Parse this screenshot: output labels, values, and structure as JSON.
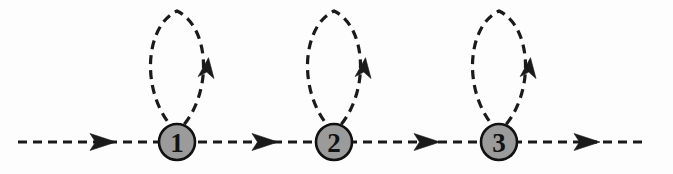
{
  "figure": {
    "background_color": "#fdfdfd",
    "line_color": "#1a1a1a",
    "vertex_fill_color": "#9b9b9b",
    "vertex_stroke_color": "#111111",
    "label_color": "#121212",
    "dash_pattern": "9 6",
    "stroke_width": 3.2,
    "width": 673,
    "height": 174
  },
  "main_line": {
    "name": "horizontal-propagator",
    "style": "dashed",
    "y": 142,
    "x_start": 18,
    "x_end": 646,
    "direction": "left-to-right",
    "arrow_positions": [
      96,
      258,
      420,
      580
    ]
  },
  "vertices": [
    {
      "id": "vertex-1",
      "label": "1",
      "cx": 177,
      "cy": 142,
      "r": 18
    },
    {
      "id": "vertex-2",
      "label": "2",
      "cx": 334,
      "cy": 142,
      "r": 18
    },
    {
      "id": "vertex-3",
      "label": "3",
      "cx": 499,
      "cy": 142,
      "r": 18
    }
  ],
  "loops": [
    {
      "id": "loop-1",
      "attached_to": "vertex-1",
      "style": "dashed",
      "apex_y": 11,
      "half_width": 31,
      "arrow_y": 70,
      "arrow_direction": "up"
    },
    {
      "id": "loop-2",
      "attached_to": "vertex-2",
      "style": "dashed",
      "apex_y": 11,
      "half_width": 31,
      "arrow_y": 70,
      "arrow_direction": "up"
    },
    {
      "id": "loop-3",
      "attached_to": "vertex-3",
      "style": "dashed",
      "apex_y": 11,
      "half_width": 31,
      "arrow_y": 70,
      "arrow_direction": "up"
    }
  ]
}
